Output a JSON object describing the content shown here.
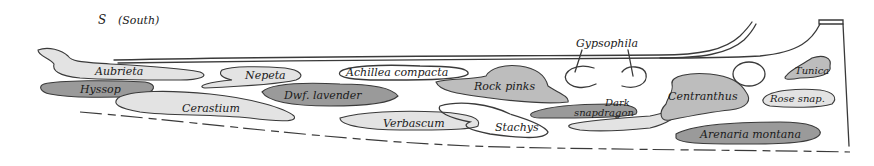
{
  "orientation": {
    "label": "S",
    "note": "(South)"
  },
  "colors": {
    "light": "#e3e3e3",
    "medium": "#bdbdbd",
    "dark": "#9a9a9a",
    "outline": "#3a3a3a",
    "text": "#1a1a1a"
  },
  "plants": [
    {
      "name": "Aubrieta",
      "shade": "light"
    },
    {
      "name": "Hyssop",
      "shade": "dark"
    },
    {
      "name": "Cerastium",
      "shade": "light"
    },
    {
      "name": "Nepeta",
      "shade": "light"
    },
    {
      "name": "Dwf. lavender",
      "shade": "dark"
    },
    {
      "name": "Achillea compacta",
      "shade": "none"
    },
    {
      "name": "Verbascum",
      "shade": "light"
    },
    {
      "name": "Rock pinks",
      "shade": "medium"
    },
    {
      "name": "Stachys",
      "shade": "none"
    },
    {
      "name": "Gypsophila",
      "shade": "none"
    },
    {
      "name": "Dark",
      "shade": "dark"
    },
    {
      "name": "snapdragon",
      "shade": "dark"
    },
    {
      "name": "Centranthus",
      "shade": "medium"
    },
    {
      "name": "Tunica",
      "shade": "medium"
    },
    {
      "name": "Rose snap.",
      "shade": "light"
    },
    {
      "name": "Arenaria montana",
      "shade": "dark"
    }
  ]
}
